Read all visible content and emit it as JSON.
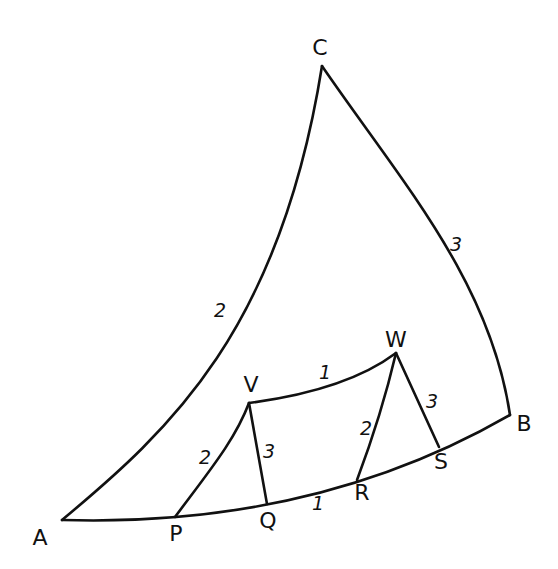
{
  "diagram": {
    "stroke_color": "#111111",
    "background": "#ffffff",
    "vertices": [
      {
        "id": "A",
        "label": "A",
        "x": 62,
        "y": 520,
        "lx": 40,
        "ly": 538
      },
      {
        "id": "B",
        "label": "B",
        "x": 510,
        "y": 415,
        "lx": 524,
        "ly": 424
      },
      {
        "id": "C",
        "label": "C",
        "x": 322,
        "y": 66,
        "lx": 320,
        "ly": 48
      },
      {
        "id": "P",
        "label": "P",
        "x": 175,
        "y": 517,
        "lx": 176,
        "ly": 534
      },
      {
        "id": "Q",
        "label": "Q",
        "x": 267,
        "y": 504,
        "lx": 268,
        "ly": 521
      },
      {
        "id": "R",
        "label": "R",
        "x": 357,
        "y": 480,
        "lx": 362,
        "ly": 493
      },
      {
        "id": "S",
        "label": "S",
        "x": 439,
        "y": 447,
        "lx": 441,
        "ly": 462
      },
      {
        "id": "V",
        "label": "V",
        "x": 249,
        "y": 403,
        "lx": 251,
        "ly": 385
      },
      {
        "id": "W",
        "label": "W",
        "x": 396,
        "y": 353,
        "lx": 396,
        "ly": 340
      }
    ],
    "edges": [
      {
        "from": "A",
        "to": "C",
        "weight": "2",
        "path": "M62,520 C170,430 280,330 322,66",
        "wx": 220,
        "wy": 310
      },
      {
        "from": "C",
        "to": "B",
        "weight": "3",
        "path": "M322,66 C400,180 490,280 510,415",
        "wx": 456,
        "wy": 244
      },
      {
        "from": "A",
        "to": "B",
        "weight": "",
        "path": "M62,520 C230,525 380,490 510,415",
        "wx": 0,
        "wy": 0
      },
      {
        "from": "P",
        "to": "V",
        "weight": "2",
        "path": "M175,517 C210,470 235,440 249,403",
        "wx": 205,
        "wy": 457
      },
      {
        "from": "V",
        "to": "Q",
        "weight": "3",
        "path": "M249,403 L267,504",
        "wx": 269,
        "wy": 451
      },
      {
        "from": "V",
        "to": "W",
        "weight": "1",
        "path": "M249,403 C310,395 360,380 396,353",
        "wx": 325,
        "wy": 372
      },
      {
        "from": "W",
        "to": "R",
        "weight": "2",
        "path": "M396,353 C385,400 372,440 357,480",
        "wx": 366,
        "wy": 428
      },
      {
        "from": "W",
        "to": "S",
        "weight": "3",
        "path": "M396,353 L439,447",
        "wx": 432,
        "wy": 401
      },
      {
        "from": "Q",
        "to": "R",
        "weight": "1",
        "path": "",
        "wx": 318,
        "wy": 503
      }
    ]
  }
}
